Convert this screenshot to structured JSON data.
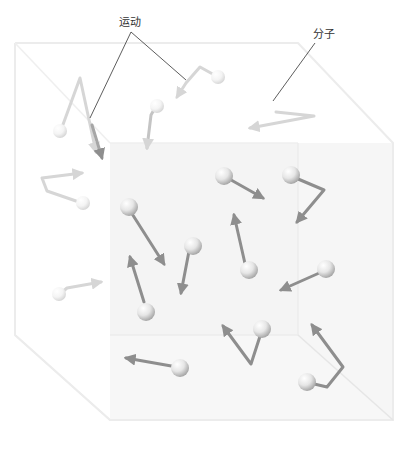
{
  "labels": {
    "motion": "运动",
    "molecule": "分子"
  },
  "colors": {
    "arrow_near": "#8e8e8e",
    "arrow_far": "#d6d6d6",
    "box_edge": "#e6e6e6",
    "back_wall": "#f3f3f3",
    "leader_line": "#333333"
  }
}
